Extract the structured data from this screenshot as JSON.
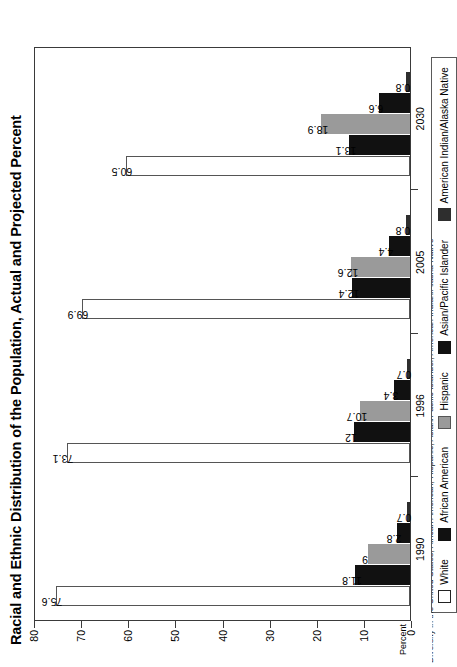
{
  "chart_data": {
    "type": "bar",
    "title": "Racial and Ethnic Distribution of the Population, Actual and Projected Percent",
    "xlabel": "",
    "ylabel": "Percent",
    "categories": [
      "1990",
      "1996",
      "2005",
      "2030"
    ],
    "series": [
      {
        "name": "White",
        "color": "#ffffff",
        "values": [
          75.6,
          73.1,
          69.9,
          60.5
        ],
        "labels": [
          "75.6",
          "73.1",
          "69.9",
          "60.5"
        ]
      },
      {
        "name": "African American",
        "color": "#111111",
        "values": [
          11.8,
          12.0,
          12.4,
          13.1
        ],
        "labels": [
          "11.8",
          "12",
          "12.4",
          "13.1"
        ]
      },
      {
        "name": "Hispanic",
        "color": "#9a9a9a",
        "values": [
          9.0,
          10.7,
          12.6,
          18.9
        ],
        "labels": [
          "9",
          "10.7",
          "12.6",
          "18.9"
        ]
      },
      {
        "name": "Asian/Pacific Islander",
        "color": "#111111",
        "values": [
          2.8,
          3.4,
          4.4,
          6.6
        ],
        "labels": [
          "2.8",
          "3.4",
          "4.4",
          "6.6"
        ]
      },
      {
        "name": "American Indian/Alaska Native",
        "color": "#2e2e2e",
        "values": [
          0.7,
          0.7,
          0.8,
          0.8
        ],
        "labels": [
          "0.7",
          "0.7",
          "0.8",
          "0.8"
        ]
      }
    ],
    "ylim": [
      0,
      80
    ],
    "yticks": [
      "0",
      "10",
      "20",
      "30",
      "40",
      "50",
      "60",
      "70",
      "80"
    ],
    "grid": false,
    "legend_position": "bottom",
    "orientation": "rotated-90-ccw"
  },
  "axis": {
    "percent_caption": "Percent"
  },
  "legend": {
    "items": [
      {
        "label": "White",
        "swatch": "white"
      },
      {
        "label": "African American",
        "swatch": "black"
      },
      {
        "label": "Hispanic",
        "swatch": "gray"
      },
      {
        "label": "Asian/Pacific Islander",
        "swatch": "black"
      },
      {
        "label": "American Indian/Alaska Native",
        "swatch": "darkgray"
      }
    ]
  },
  "source_caption": {
    "text": "Diversity in the United States, African American, Hispanic, Asian/Pacific Islander, American Indian/Alaska Native"
  }
}
